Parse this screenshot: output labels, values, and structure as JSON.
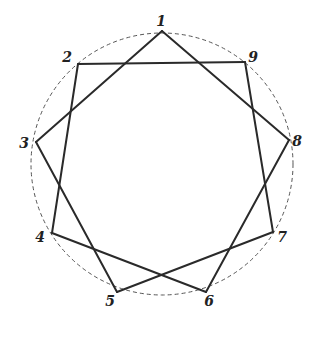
{
  "diagram": {
    "type": "star-polygon",
    "notation": "{9/2}",
    "circle": {
      "cx": 162,
      "cy": 164,
      "r": 131,
      "style": "dashed",
      "color": "#555555"
    },
    "stroke_color": "#2a2a2a",
    "vertices": [
      {
        "label": "1",
        "x": 162,
        "y": 31,
        "lx": 161,
        "ly": 26
      },
      {
        "label": "2",
        "x": 78,
        "y": 64,
        "lx": 67,
        "ly": 62
      },
      {
        "label": "3",
        "x": 36,
        "y": 142,
        "lx": 24,
        "ly": 148
      },
      {
        "label": "4",
        "x": 52,
        "y": 233,
        "lx": 40,
        "ly": 242
      },
      {
        "label": "5",
        "x": 117,
        "y": 292,
        "lx": 110,
        "ly": 306
      },
      {
        "label": "6",
        "x": 206,
        "y": 292,
        "lx": 209,
        "ly": 306
      },
      {
        "label": "7",
        "x": 273,
        "y": 232,
        "lx": 282,
        "ly": 242
      },
      {
        "label": "8",
        "x": 289,
        "y": 140,
        "lx": 297,
        "ly": 146
      },
      {
        "label": "9",
        "x": 245,
        "y": 62,
        "lx": 253,
        "ly": 62
      }
    ],
    "edges": [
      [
        1,
        3
      ],
      [
        3,
        5
      ],
      [
        5,
        7
      ],
      [
        7,
        9
      ],
      [
        9,
        2
      ],
      [
        2,
        4
      ],
      [
        4,
        6
      ],
      [
        6,
        8
      ],
      [
        8,
        1
      ]
    ]
  }
}
